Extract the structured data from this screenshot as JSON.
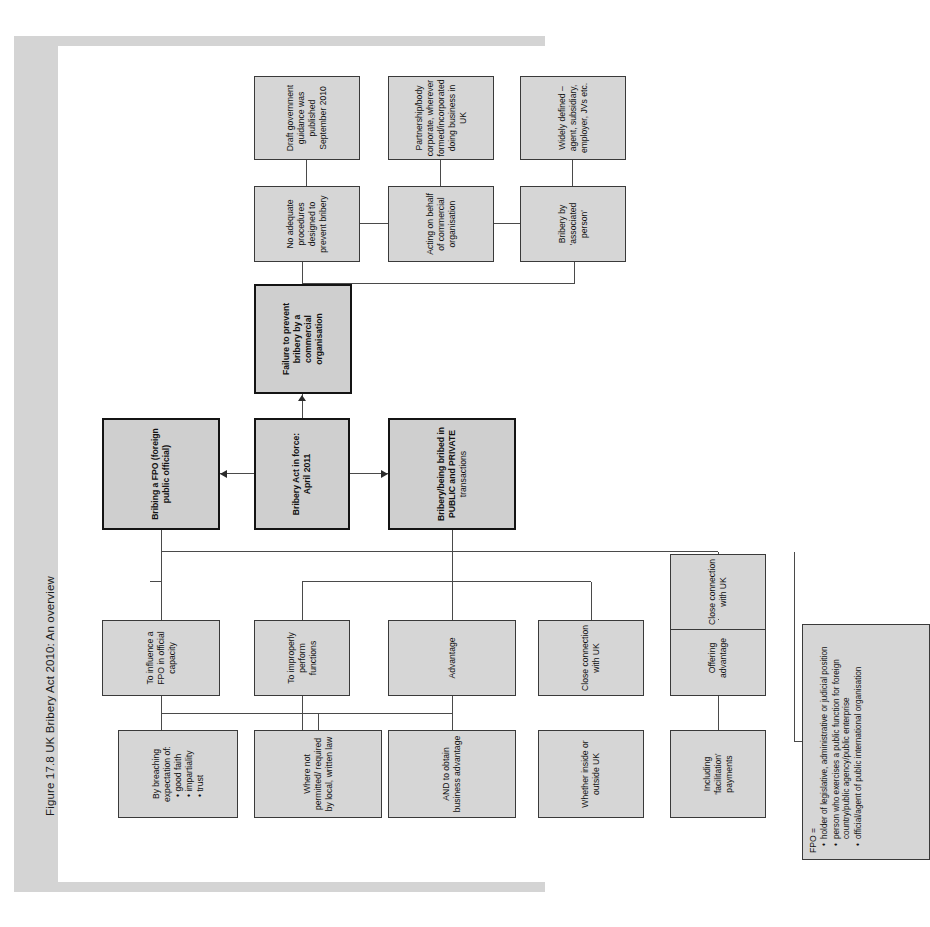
{
  "figure": {
    "title": "Figure 17.8  UK Bribery Act 2010: An overview"
  },
  "colors": {
    "node_fill": "#d6d6d6",
    "node_border": "#3a3a3a",
    "band": "#d4d4d4",
    "page_bg": "#ffffff"
  },
  "chart_data": {
    "type": "diagram",
    "title": "Figure 17.8  UK Bribery Act 2010: An overview",
    "orientation": "rotated-90-ccw",
    "nodes": [
      {
        "id": "act",
        "label": "Bribery Act in force: April 2011",
        "emphasis": "bold"
      },
      {
        "id": "pubpriv",
        "label": "Bribery/being bribed in PUBLIC and PRIVATE transactions",
        "emphasis": "bold"
      },
      {
        "id": "fpo",
        "label": "Bribing a FPO (foreign public official)",
        "emphasis": "bold"
      },
      {
        "id": "failure",
        "label": "Failure to prevent bribery by a commercial organisation",
        "emphasis": "bold"
      },
      {
        "id": "advantage",
        "label": "Advantage"
      },
      {
        "id": "improper",
        "label": "To improperly perform functions"
      },
      {
        "id": "offering",
        "label": "Offering, promising or giving"
      },
      {
        "id": "requesting",
        "label": "Requesting, agreeing to receive or accepting"
      },
      {
        "id": "breaching",
        "label": "By breaching expectation of:"
      },
      {
        "id": "whether",
        "label": "Whether inside or outside UK"
      },
      {
        "id": "closeuk1",
        "label": "Close connection with UK"
      },
      {
        "id": "influence",
        "label": "To influence a FPO in official capacity"
      },
      {
        "id": "andobtain",
        "label": "AND to obtain business advantage"
      },
      {
        "id": "offeradv",
        "label": "Offering advantage"
      },
      {
        "id": "wherenot",
        "label": "Where not permitted/ required by local, written law"
      },
      {
        "id": "facilitation",
        "label": "Including 'facilitation' payments"
      },
      {
        "id": "closeuk2",
        "label": "Close connection with UK"
      },
      {
        "id": "fpodef",
        "label": "FPO ="
      },
      {
        "id": "noadequate",
        "label": "No adequate procedures designed to prevent bribery"
      },
      {
        "id": "acting",
        "label": "Acting on behalf of commercial organisation"
      },
      {
        "id": "assocperson",
        "label": "Bribery by 'associated person'"
      },
      {
        "id": "draftguide",
        "label": "Draft government guidance was published September 2010"
      },
      {
        "id": "partnership",
        "label": "Partnership/body corporate, wherever formed/incorporated doing business in UK"
      },
      {
        "id": "widely",
        "label": "Widely defined – agent, subsidiary, employer, JVs etc."
      }
    ],
    "breaching_bullets": [
      "good faith",
      "impartiality",
      "trust"
    ],
    "fpo_bullets": [
      "holder of legislative, administrative or judicial position",
      "person who exercises a public function for foreign country/public agency/public enterprise",
      "official/agent of public international organisation"
    ],
    "edges": [
      {
        "from": "act",
        "to": "pubpriv",
        "type": "arrow"
      },
      {
        "from": "act",
        "to": "fpo",
        "type": "arrow"
      },
      {
        "from": "act",
        "to": "failure",
        "type": "arrow"
      },
      {
        "from": "pubpriv",
        "to": "advantage",
        "type": "line"
      },
      {
        "from": "pubpriv",
        "to": "improper",
        "type": "line"
      },
      {
        "from": "pubpriv",
        "to": "closeuk1",
        "type": "line"
      },
      {
        "from": "advantage",
        "to": "offering",
        "type": "line"
      },
      {
        "from": "advantage",
        "to": "requesting",
        "type": "line"
      },
      {
        "from": "improper",
        "to": "breaching",
        "type": "line"
      },
      {
        "from": "breaching",
        "to": "whether",
        "type": "line"
      },
      {
        "from": "fpo",
        "to": "influence",
        "type": "line"
      },
      {
        "from": "fpo",
        "to": "closeuk2",
        "type": "line"
      },
      {
        "from": "fpo",
        "to": "fpodef",
        "type": "line"
      },
      {
        "from": "influence",
        "to": "andobtain",
        "type": "line"
      },
      {
        "from": "andobtain",
        "to": "offeradv",
        "type": "line"
      },
      {
        "from": "andobtain",
        "to": "wherenot",
        "type": "line"
      },
      {
        "from": "offeradv",
        "to": "facilitation",
        "type": "line"
      },
      {
        "from": "failure",
        "to": "noadequate",
        "type": "line"
      },
      {
        "from": "failure",
        "to": "assocperson",
        "type": "line"
      },
      {
        "from": "noadequate",
        "to": "draftguide",
        "type": "line"
      },
      {
        "from": "noadequate",
        "to": "acting",
        "type": "line"
      },
      {
        "from": "acting",
        "to": "partnership",
        "type": "line"
      },
      {
        "from": "assocperson",
        "to": "widely",
        "type": "line"
      }
    ]
  },
  "nodes": {
    "act": "Bribery Act in force: April 2011",
    "pubpriv_l1": "Bribery/being bribed in",
    "pubpriv_l2": "PUBLIC and PRIVATE",
    "pubpriv_l3": "transactions",
    "fpo": "Bribing a FPO (foreign public official)",
    "failure": "Failure to prevent bribery by a commercial organisation",
    "advantage": "Advantage",
    "improper": "To improperly perform functions",
    "offering": "Offering, promising or giving",
    "requesting": "Requesting, agreeing to receive or accepting",
    "breaching_head": "By breaching expectation of:",
    "breaching_b1": "good faith",
    "breaching_b2": "impartiality",
    "breaching_b3": "trust",
    "whether": "Whether inside or outside UK",
    "closeuk1": "Close connection with UK",
    "influence": "To influence a FPO in official capacity",
    "andobtain": "AND to obtain business advantage",
    "offeradv": "Offering advantage",
    "wherenot": "Where not permitted/ required by local, written law",
    "facilitation": "Including 'facilitation' payments",
    "closeuk2": "Close connection with UK",
    "fpodef_head": "FPO =",
    "fpodef_b1": "holder of legislative, administrative or judicial position",
    "fpodef_b2": "person who exercises a public function for foreign country/public agency/public enterprise",
    "fpodef_b3": "official/agent of public international organisation",
    "noadequate": "No adequate procedures designed to prevent bribery",
    "acting": "Acting on behalf of commercial organisation",
    "assocperson": "Bribery by 'associated person'",
    "draftguide": "Draft government guidance was published September 2010",
    "partnership": "Partnership/body corporate, wherever formed/incorporated doing business in UK",
    "widely": "Widely defined – agent, subsidiary, employer, JVs etc."
  }
}
